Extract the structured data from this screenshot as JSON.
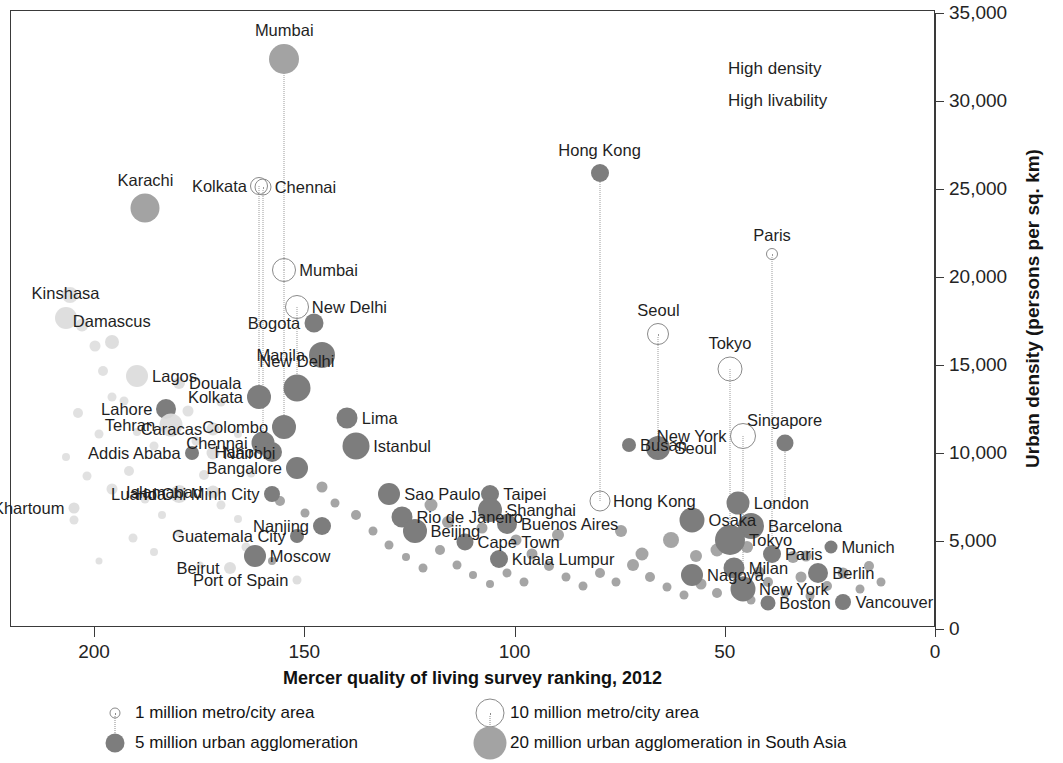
{
  "chart_data": {
    "type": "scatter",
    "title": "",
    "xlabel": "Mercer quality of living survey ranking, 2012",
    "ylabel": "Urban density (persons per sq. km)",
    "xlim": [
      210,
      0
    ],
    "ylim": [
      0,
      35000
    ],
    "x_ticks": [
      200,
      150,
      100,
      50,
      0
    ],
    "x_tick_labels": [
      "200",
      "150",
      "100",
      "50",
      "0"
    ],
    "y_ticks": [
      0,
      5000,
      10000,
      15000,
      20000,
      25000,
      30000,
      35000
    ],
    "y_tick_labels": [
      "0",
      "5,000",
      "10,000",
      "15,000",
      "20,000",
      "25,000",
      "30,000",
      "35,000"
    ],
    "grid": false,
    "legend_position": "below-axis",
    "annotations": [
      {
        "text": "High density",
        "x": 68,
        "y": 32300
      },
      {
        "text": "High livability",
        "x": 68,
        "y": 30200
      }
    ],
    "labeled_points": [
      {
        "city": "Mumbai",
        "x": 155,
        "y": 32300,
        "size": 30,
        "style": "filled-south-asia",
        "label_pos": "top"
      },
      {
        "city": "Karachi",
        "x": 188,
        "y": 23800,
        "size": 29,
        "style": "filled-south-asia",
        "label_pos": "top"
      },
      {
        "city": "Kolkata",
        "x": 161,
        "y": 25100,
        "size": 16,
        "style": "open",
        "label_pos": "left"
      },
      {
        "city": "Chennai",
        "x": 160,
        "y": 25000,
        "size": 15,
        "style": "open",
        "label_pos": "right"
      },
      {
        "city": "Mumbai",
        "x": 155,
        "y": 20300,
        "size": 22,
        "style": "open",
        "label_pos": "right"
      },
      {
        "city": "New Delhi",
        "x": 152,
        "y": 18200,
        "size": 22,
        "style": "open",
        "label_pos": "right"
      },
      {
        "city": "Hong Kong",
        "x": 80,
        "y": 25800,
        "size": 18,
        "style": "filled",
        "label_pos": "top"
      },
      {
        "city": "Paris",
        "x": 39,
        "y": 21200,
        "size": 10,
        "style": "open",
        "label_pos": "top"
      },
      {
        "city": "Seoul",
        "x": 66,
        "y": 16700,
        "size": 20,
        "style": "open",
        "label_pos": "top"
      },
      {
        "city": "Tokyo",
        "x": 49,
        "y": 14700,
        "size": 23,
        "style": "open",
        "label_pos": "top"
      },
      {
        "city": "New York",
        "x": 46,
        "y": 10900,
        "size": 24,
        "style": "open",
        "label_pos": "left"
      },
      {
        "city": "Singapore",
        "x": 36,
        "y": 10500,
        "size": 17,
        "style": "filled",
        "label_pos": "top"
      },
      {
        "city": "Kinshasa",
        "x": 207,
        "y": 17600,
        "size": 22,
        "style": "faint",
        "label_pos": "top"
      },
      {
        "city": "Damascus",
        "x": 196,
        "y": 16200,
        "size": 14,
        "style": "faint",
        "label_pos": "top"
      },
      {
        "city": "Lagos",
        "x": 190,
        "y": 14300,
        "size": 22,
        "style": "faint",
        "label_pos": "right"
      },
      {
        "city": "Douala",
        "x": 180,
        "y": 13900,
        "size": 12,
        "style": "faint",
        "label_pos": "right"
      },
      {
        "city": "Lahore",
        "x": 183,
        "y": 12400,
        "size": 20,
        "style": "filled",
        "label_pos": "left"
      },
      {
        "city": "Tehran",
        "x": 182,
        "y": 11500,
        "size": 23,
        "style": "faint",
        "label_pos": "left"
      },
      {
        "city": "Caracas",
        "x": 172,
        "y": 11300,
        "size": 13,
        "style": "faint",
        "label_pos": "left"
      },
      {
        "city": "Kolkata",
        "x": 161,
        "y": 13100,
        "size": 24,
        "style": "filled",
        "label_pos": "left"
      },
      {
        "city": "New Delhi",
        "x": 152,
        "y": 13600,
        "size": 27,
        "style": "filled",
        "label_pos": "top"
      },
      {
        "city": "Addis Ababa",
        "x": 177,
        "y": 9900,
        "size": 14,
        "style": "filled",
        "label_pos": "left"
      },
      {
        "city": "Nairobi",
        "x": 172,
        "y": 9900,
        "size": 13,
        "style": "faint",
        "label_pos": "right"
      },
      {
        "city": "Luanda",
        "x": 180,
        "y": 7600,
        "size": 18,
        "style": "faint",
        "label_pos": "left"
      },
      {
        "city": "Islamabad",
        "x": 172,
        "y": 7700,
        "size": 13,
        "style": "faint",
        "label_pos": "left"
      },
      {
        "city": "Khartoum",
        "x": 205,
        "y": 6800,
        "size": 11,
        "style": "faint",
        "label_pos": "left"
      },
      {
        "city": "Chennai",
        "x": 160,
        "y": 10500,
        "size": 23,
        "style": "filled",
        "label_pos": "left"
      },
      {
        "city": "Hanoi",
        "x": 158,
        "y": 10000,
        "size": 20,
        "style": "filled",
        "label_pos": "left"
      },
      {
        "city": "Colombo",
        "x": 155,
        "y": 11400,
        "size": 24,
        "style": "filled",
        "label_pos": "left"
      },
      {
        "city": "Bangalore",
        "x": 152,
        "y": 9100,
        "size": 22,
        "style": "filled",
        "label_pos": "left"
      },
      {
        "city": "Ho Chi Minh City",
        "x": 158,
        "y": 7600,
        "size": 16,
        "style": "filled",
        "label_pos": "left"
      },
      {
        "city": "Nanjing",
        "x": 146,
        "y": 5800,
        "size": 18,
        "style": "filled",
        "label_pos": "left"
      },
      {
        "city": "Guatemala City",
        "x": 152,
        "y": 5200,
        "size": 14,
        "style": "filled",
        "label_pos": "left"
      },
      {
        "city": "Moscow",
        "x": 162,
        "y": 4100,
        "size": 22,
        "style": "filled",
        "label_pos": "right"
      },
      {
        "city": "Beirut",
        "x": 168,
        "y": 3400,
        "size": 12,
        "style": "faint",
        "label_pos": "left"
      },
      {
        "city": "Port of Spain",
        "x": 152,
        "y": 2700,
        "size": 9,
        "style": "faint",
        "label_pos": "left"
      },
      {
        "city": "Bogota",
        "x": 148,
        "y": 17300,
        "size": 19,
        "style": "filled",
        "label_pos": "left"
      },
      {
        "city": "Manila",
        "x": 146,
        "y": 15500,
        "size": 26,
        "style": "filled",
        "label_pos": "left"
      },
      {
        "city": "Lima",
        "x": 140,
        "y": 11900,
        "size": 21,
        "style": "filled",
        "label_pos": "right"
      },
      {
        "city": "Istanbul",
        "x": 138,
        "y": 10300,
        "size": 27,
        "style": "filled",
        "label_pos": "right"
      },
      {
        "city": "Sao Paulo",
        "x": 130,
        "y": 7600,
        "size": 22,
        "style": "filled",
        "label_pos": "right"
      },
      {
        "city": "Rio de Janeiro",
        "x": 127,
        "y": 6300,
        "size": 21,
        "style": "filled",
        "label_pos": "right"
      },
      {
        "city": "Beijing",
        "x": 124,
        "y": 5500,
        "size": 24,
        "style": "filled",
        "label_pos": "right"
      },
      {
        "city": "Taipei",
        "x": 106,
        "y": 7600,
        "size": 18,
        "style": "filled",
        "label_pos": "right"
      },
      {
        "city": "Shanghai",
        "x": 106,
        "y": 6700,
        "size": 24,
        "style": "filled",
        "label_pos": "right"
      },
      {
        "city": "Buenos Aires",
        "x": 102,
        "y": 5900,
        "size": 20,
        "style": "filled",
        "label_pos": "right"
      },
      {
        "city": "Cape Town",
        "x": 112,
        "y": 4900,
        "size": 17,
        "style": "filled",
        "label_pos": "right"
      },
      {
        "city": "Kuala Lumpur",
        "x": 104,
        "y": 3900,
        "size": 18,
        "style": "filled",
        "label_pos": "right"
      },
      {
        "city": "Busan",
        "x": 73,
        "y": 10400,
        "size": 14,
        "style": "filled",
        "label_pos": "right"
      },
      {
        "city": "Seoul",
        "x": 66,
        "y": 10200,
        "size": 24,
        "style": "filled",
        "label_pos": "right"
      },
      {
        "city": "Hong Kong",
        "x": 80,
        "y": 7200,
        "size": 19,
        "style": "open",
        "label_pos": "right"
      },
      {
        "city": "Osaka",
        "x": 58,
        "y": 6100,
        "size": 25,
        "style": "filled",
        "label_pos": "right"
      },
      {
        "city": "London",
        "x": 47,
        "y": 7100,
        "size": 23,
        "style": "filled",
        "label_pos": "right"
      },
      {
        "city": "Barcelona",
        "x": 44,
        "y": 5800,
        "size": 26,
        "style": "filled",
        "label_pos": "right"
      },
      {
        "city": "Tokyo",
        "x": 49,
        "y": 5000,
        "size": 30,
        "style": "filled",
        "label_pos": "right"
      },
      {
        "city": "Nagoya",
        "x": 58,
        "y": 3000,
        "size": 22,
        "style": "filled",
        "label_pos": "right"
      },
      {
        "city": "Milan",
        "x": 48,
        "y": 3400,
        "size": 21,
        "style": "filled",
        "label_pos": "right"
      },
      {
        "city": "New York",
        "x": 46,
        "y": 2200,
        "size": 25,
        "style": "filled",
        "label_pos": "right"
      },
      {
        "city": "Boston",
        "x": 40,
        "y": 1400,
        "size": 15,
        "style": "filled",
        "label_pos": "right"
      },
      {
        "city": "Paris",
        "x": 39,
        "y": 4200,
        "size": 18,
        "style": "filled",
        "label_pos": "right"
      },
      {
        "city": "Berlin",
        "x": 28,
        "y": 3100,
        "size": 20,
        "style": "filled",
        "label_pos": "right"
      },
      {
        "city": "Munich",
        "x": 25,
        "y": 4600,
        "size": 13,
        "style": "filled",
        "label_pos": "right"
      },
      {
        "city": "Vancouver",
        "x": 22,
        "y": 1500,
        "size": 16,
        "style": "filled",
        "label_pos": "right"
      }
    ]
  },
  "axes": {
    "y_title": "Urban density (persons per sq. km)",
    "x_title": "Mercer quality of living survey ranking, 2012",
    "y_labels": [
      "35,000",
      "30,000",
      "25,000",
      "20,000",
      "15,000",
      "10,000",
      "5,000",
      "0"
    ],
    "x_labels": [
      "200",
      "150",
      "100",
      "50",
      "0"
    ]
  },
  "annotations": {
    "high_density": "High density",
    "high_livability": "High livability"
  },
  "legend": {
    "items": [
      {
        "label": "1 million metro/city area",
        "style": "open",
        "size": 9
      },
      {
        "label": "5 million urban agglomeration",
        "style": "filled",
        "size": 19
      },
      {
        "label": "10 million metro/city area",
        "style": "open",
        "size": 27
      },
      {
        "label": "20 million urban agglomeration in South Asia",
        "style": "filled-south-asia",
        "size": 33
      }
    ]
  },
  "colors": {
    "filled": "#7d7d7d",
    "filled_south_asia": "#a3a3a3",
    "faint": "#dcdcdc",
    "open_stroke": "#8a8a8a",
    "axis": "#3a3a3a",
    "text": "#1a1a1a"
  },
  "labels": {
    "mumbai_top": "Mumbai",
    "karachi": "Karachi",
    "kolkata_open": "Kolkata",
    "chennai_open": "Chennai",
    "mumbai_open": "Mumbai",
    "newdelhi_open": "New Delhi",
    "hongkong_top": "Hong Kong",
    "paris_open": "Paris",
    "seoul_open": "Seoul",
    "tokyo_open": "Tokyo",
    "newyork_open": "New York",
    "singapore": "Singapore",
    "kinshasa": "Kinshasa",
    "damascus": "Damascus",
    "lagos": "Lagos",
    "douala": "Douala",
    "lahore": "Lahore",
    "tehran": "Tehran",
    "caracas": "Caracas",
    "kolkata": "Kolkata",
    "newdelhi": "New Delhi",
    "addisababa": "Addis Ababa",
    "nairobi": "Nairobi",
    "luanda": "Luanda",
    "islamabad": "Islamabad",
    "khartoum": "Khartoum",
    "chennai": "Chennai",
    "hanoi": "Hanoi",
    "colombo": "Colombo",
    "bangalore": "Bangalore",
    "hochiminh": "Ho Chi Minh City",
    "nanjing": "Nanjing",
    "guatemala": "Guatemala City",
    "moscow": "Moscow",
    "beirut": "Beirut",
    "portofspain": "Port of Spain",
    "bogota": "Bogotá",
    "manila": "Manila",
    "lima": "Lima",
    "istanbul": "Istanbul",
    "saopaulo": "São Paulo",
    "rio": "Rio de Janeiro",
    "beijing": "Beijing",
    "taipei": "Taipei",
    "shanghai": "Shanghai",
    "buenosaires": "Buenos Aires",
    "capetown": "Cape Town",
    "kualalumpur": "Kuala Lumpur",
    "busan": "Busan",
    "seoul": "Seoul",
    "hongkong": "Hong Kong",
    "osaka": "Osaka",
    "london": "London",
    "barcelona": "Barcelona",
    "tokyo": "Tokyo",
    "nagoya": "Nagoya",
    "milan": "Milan",
    "newyork": "New York",
    "boston": "Boston",
    "paris": "Paris",
    "berlin": "Berlin",
    "munich": "Munich",
    "vancouver": "Vancouver"
  }
}
